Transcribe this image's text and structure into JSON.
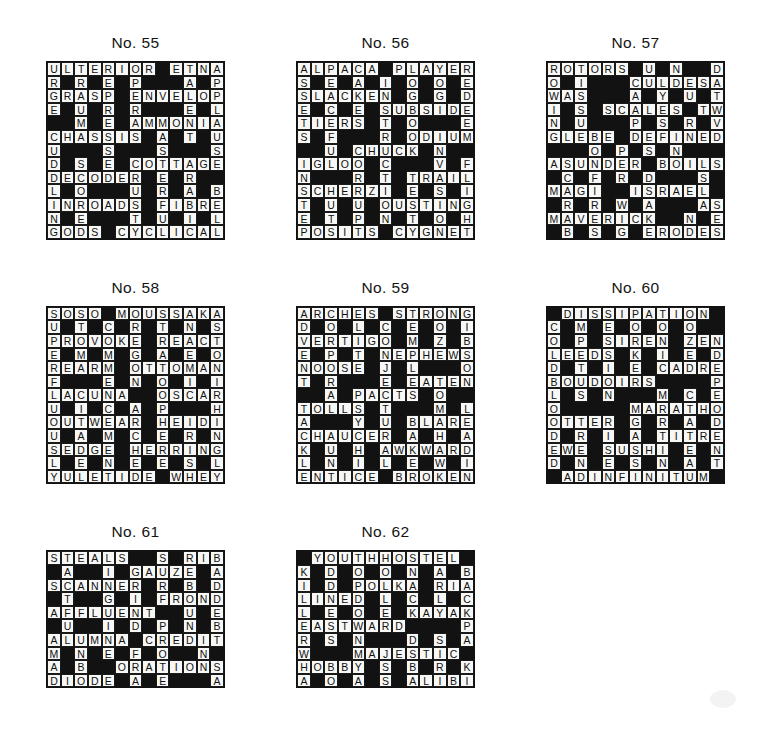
{
  "page": {
    "background_color": "#ffffff",
    "ink_color": "#111111",
    "cell_fill_color": "#f7f7f5"
  },
  "rows": [
    {
      "name": "top-row",
      "puzzles": [
        0,
        1,
        2
      ]
    },
    {
      "name": "middle-row",
      "puzzles": [
        3,
        4,
        5
      ]
    },
    {
      "name": "bottom-row",
      "puzzles": [
        6,
        7
      ]
    }
  ],
  "puzzles": [
    {
      "title": "No. 55",
      "number": 55,
      "cols": 13,
      "rows": 13,
      "grid": [
        "ULTERIOR#ETNA",
        "R#R#E#P###A#P",
        "GRASP#ENVELOP",
        "E#U#R#R###E#L",
        "##M#E#AMMONIA",
        "CHASSIS#A#T#U",
        "U###S###S###S",
        "D#S#E#COTTAGE",
        "DECODER#E#R##",
        "L#O###U#R#A#B",
        "INROADS#FIBRE",
        "N#E###T#U#I#L",
        "GODS#CYCLICAL"
      ]
    },
    {
      "title": "No. 56",
      "number": 56,
      "cols": 13,
      "rows": 13,
      "grid": [
        "ALPACA#PLAYER",
        "S#E#A#I#O#O#E",
        "SLACKEN#G#G#D",
        "E#C#E#SUBSIDE",
        "TIERS#T#O###E",
        "S#F###R#ODIUM",
        "##U#CHUCK#N##",
        "IGLOO#C###V#F",
        "N###R#T#TRAIL",
        "SCHERZI#E#S#I",
        "T#U#U#OUSTING",
        "E#T#P#N#T#O#H",
        "POSITS#CYGNET"
      ]
    },
    {
      "title": "No. 57",
      "number": 57,
      "cols": 13,
      "rows": 13,
      "grid": [
        "ROTORS#U#N##D",
        "O#I###CULDESA",
        "WAS###A#Y#U#T",
        "I#S#SCALES#TWI",
        "N#U###P#S#R#V",
        "GLEBE#DEFINED",
        "###O#P#S#N###",
        "ASUNDER#BOILS",
        "#C#F#R#D###S#",
        "MAGI##ISRAEL#",
        "#R#R#W#A###AS",
        "MAVERICK##N#E",
        "#B#S#G#ERODES"
      ]
    },
    {
      "title": "No. 58",
      "number": 58,
      "cols": 13,
      "rows": 13,
      "grid": [
        "SOSO#MOUSSAKA",
        "U#T#C#R#T#N#S",
        "PROVOKE#REACT",
        "E#M#M#G#A#E#O",
        "REARM#OTTOMAN",
        "F###E#N#O#I#I",
        "LACUNA##OSCARS",
        "U#I#C#A#P###H",
        "OUTWEAR#HEIDI",
        "U#A#M#C#E#R#N",
        "SEDGE#HERRING",
        "L#E#N#E#E#S#L",
        "YULETIDE#WHEY"
      ]
    },
    {
      "title": "No. 59",
      "number": 59,
      "cols": 13,
      "rows": 13,
      "grid": [
        "ARCHES#STRONG",
        "D#O#L#C#E#O#I",
        "VERTIGO#M#Z#B",
        "E#P#T#NEPHEWS",
        "NOOSE#J#L###O",
        "T#R###E#EATEN",
        "##A#PACTS#O##",
        "TOLLS#T###M#L",
        "A###Y#U#BLARE",
        "CHAUCER#A#H#A",
        "K#U#H#AWKWARD",
        "L#N#I#L#E#W#I",
        "ENTICE#BROKEN"
      ]
    },
    {
      "title": "No. 60",
      "number": 60,
      "cols": 13,
      "rows": 13,
      "grid": [
        "#DISSIPATION#",
        "C#M#E#O#O#O##",
        "O#P#SIREN#ZEN",
        "LEEDS#K#I#E#D",
        "D#T#I#E#CADRE",
        "BOUDOIRS####P",
        "L#S#N###M#C#E",
        "O#####MARATHON",
        "OTTER#G#R#A#D",
        "D#R#I#A#TITRE",
        "EWE#SUSHI#E#N",
        "D#N#E#S#N#A#T",
        "#ADINFINITUM#"
      ]
    },
    {
      "title": "No. 61",
      "number": 61,
      "cols": 13,
      "rows": 13,
      "grid": [
        "STEALS##S#RIB",
        "#A##I#GAUZE#A",
        "SCANNER#R#B#D",
        "#T##G#I#FROND",
        "AFFLUENT##U#E",
        "#U##I#D#P#N#B",
        "ALUMNA#CREDIT",
        "M#N#E#F#O##N#",
        "A#B##ORATIONS",
        "DIODE#A#E###A"
      ]
    },
    {
      "title": "No. 62",
      "number": 62,
      "cols": 13,
      "rows": 13,
      "grid": [
        "#YOUTHHOSTEL#",
        "K#D#O#O#N#A#B",
        "I#D#POLKA#RIA",
        "LINED#L#C#L#C",
        "L#E#O#E#KAYAK",
        "EASTWARD####P",
        "R#S#N###D#S#A",
        "W###MAJESTIC#",
        "HOBBY#S#B#R#K",
        "A#O#A#S#ALIBI"
      ]
    }
  ]
}
